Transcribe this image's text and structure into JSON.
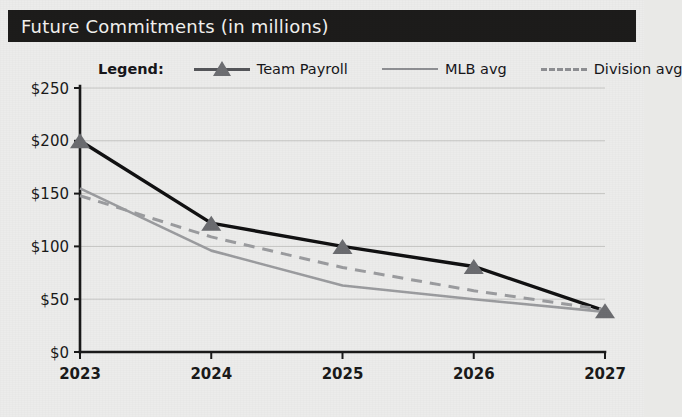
{
  "header": {
    "title": "Future Commitments (in millions)"
  },
  "legend": {
    "label": "Legend:",
    "entries": [
      {
        "name": "team-payroll",
        "label": "Team Payroll",
        "style": "solid-with-triangle",
        "color": "#111112"
      },
      {
        "name": "mlb-avg",
        "label": "MLB avg",
        "style": "solid",
        "color": "#9b9c9f"
      },
      {
        "name": "division-avg",
        "label": "Division avg",
        "style": "dashed",
        "color": "#9b9c9f"
      }
    ]
  },
  "axes": {
    "y_ticks": [
      "$0",
      "$50",
      "$100",
      "$150",
      "$200",
      "$250"
    ],
    "x_ticks": [
      "2023",
      "2024",
      "2025",
      "2026",
      "2027"
    ]
  },
  "chart_data": {
    "type": "line",
    "title": "Future Commitments (in millions)",
    "xlabel": "",
    "ylabel": "",
    "categories": [
      "2023",
      "2024",
      "2025",
      "2026",
      "2027"
    ],
    "x": [
      2023,
      2024,
      2025,
      2026,
      2027
    ],
    "ylim": [
      0,
      250
    ],
    "ytick_values": [
      0,
      50,
      100,
      150,
      200,
      250
    ],
    "ytick_labels": [
      "$0",
      "$50",
      "$100",
      "$150",
      "$200",
      "$250"
    ],
    "grid": "horizontal",
    "legend_position": "above-plot",
    "units": "millions of dollars",
    "series": [
      {
        "name": "Team Payroll",
        "values": [
          200,
          122,
          100,
          81,
          39
        ],
        "marker": "triangle",
        "linestyle": "solid",
        "color": "#111112"
      },
      {
        "name": "MLB avg",
        "values": [
          155,
          96,
          63,
          50,
          38
        ],
        "marker": "none",
        "linestyle": "solid",
        "color": "#9b9c9f"
      },
      {
        "name": "Division avg",
        "values": [
          148,
          109,
          80,
          58,
          40
        ],
        "marker": "none",
        "linestyle": "dashed",
        "color": "#9b9c9f"
      }
    ]
  }
}
